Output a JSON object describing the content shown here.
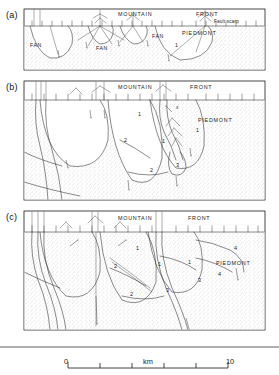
{
  "figure": {
    "type": "geological-cross-section",
    "panels": [
      {
        "tag": "(a)",
        "labels": {
          "mountain": "MOUNTAIN",
          "front": "FRONT",
          "fault_scarp": "Fault scarp",
          "piedmont": "PIEDMONT",
          "fan": "FAN",
          "units": [
            "1"
          ]
        },
        "fan_label_count": 3
      },
      {
        "tag": "(b)",
        "labels": {
          "mountain": "MOUNTAIN",
          "front": "FRONT",
          "piedmont": "PIEDMONT",
          "marker": "x",
          "units": [
            "1",
            "1",
            "1",
            "2",
            "2",
            "3"
          ]
        }
      },
      {
        "tag": "(c)",
        "labels": {
          "mountain": "MOUNTAIN",
          "front": "FRONT",
          "piedmont": "PIEDMONT",
          "units": [
            "1",
            "1",
            "1",
            "2",
            "2",
            "3",
            "3",
            "4",
            "4"
          ]
        }
      }
    ]
  },
  "scale_bar": {
    "start_label": "0",
    "end_label": "10",
    "unit_label": "km",
    "divisions": 5,
    "span_km": 10
  },
  "colors": {
    "ink": "#1a1a1a",
    "line": "#2a2a2a",
    "stipple": "#8a8a8a",
    "background": "#ffffff"
  }
}
